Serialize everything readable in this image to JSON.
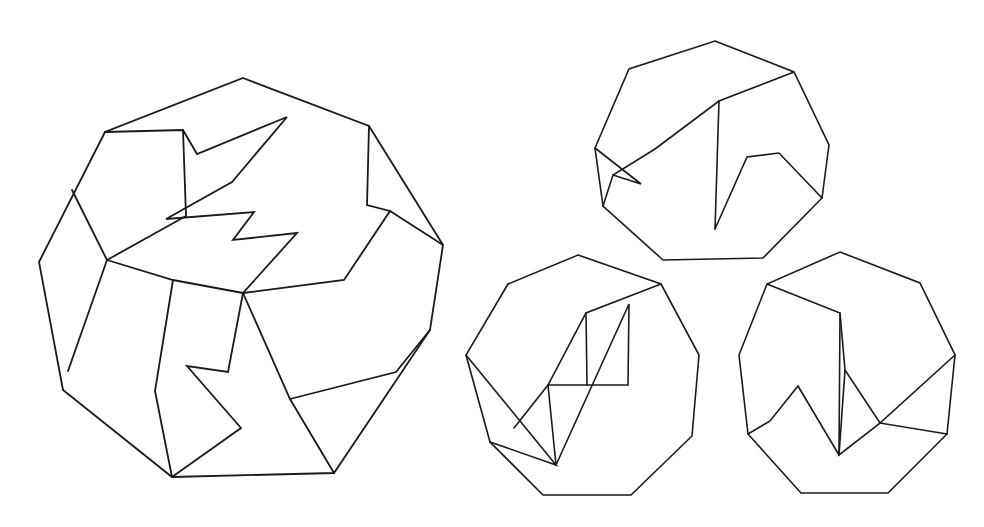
{
  "page": {
    "background_color": "#ffffff",
    "stroke_color": "#1a1a1a",
    "width": 984,
    "height": 527
  },
  "figures": [
    {
      "id": "large-nonagon",
      "name": "large-dissected-nonagon",
      "role": "source-polygon",
      "stroke_width": 1.8,
      "outline_label": "outer nonagon boundary",
      "outline": [
        [
          243,
          78
        ],
        [
          369,
          126
        ],
        [
          443,
          245
        ],
        [
          430,
          330
        ],
        [
          334,
          473
        ],
        [
          172,
          477
        ],
        [
          63,
          390
        ],
        [
          39,
          262
        ],
        [
          105,
          132
        ]
      ],
      "cuts": [
        {
          "name": "cut-upper-zigzag",
          "points": [
            [
              105,
              132
            ],
            [
              183,
              130
            ],
            [
              197,
              154
            ],
            [
              287,
              117
            ],
            [
              232,
              182
            ],
            [
              166,
              219
            ],
            [
              254,
              212
            ],
            [
              233,
              240
            ],
            [
              297,
              233
            ],
            [
              243,
              293
            ]
          ]
        },
        {
          "name": "cut-left-spoke",
          "points": [
            [
              183,
              130
            ],
            [
              186,
              216
            ],
            [
              107,
              260
            ],
            [
              68,
              371
            ]
          ]
        },
        {
          "name": "cut-left-mid-chord",
          "points": [
            [
              72,
              190
            ],
            [
              107,
              260
            ]
          ]
        },
        {
          "name": "cut-lower-left-chord",
          "points": [
            [
              107,
              260
            ],
            [
              173,
              280
            ],
            [
              243,
              293
            ]
          ]
        },
        {
          "name": "cut-lower-left-spoke",
          "points": [
            [
              173,
              280
            ],
            [
              155,
              391
            ],
            [
              172,
              477
            ]
          ]
        },
        {
          "name": "cut-lower-zigzag",
          "points": [
            [
              243,
              293
            ],
            [
              228,
              372
            ],
            [
              187,
              366
            ],
            [
              241,
              428
            ],
            [
              172,
              477
            ]
          ]
        },
        {
          "name": "cut-lower-right-spoke",
          "points": [
            [
              243,
              293
            ],
            [
              290,
              399
            ],
            [
              334,
              473
            ]
          ]
        },
        {
          "name": "cut-right-lower-chord",
          "points": [
            [
              290,
              399
            ],
            [
              396,
              372
            ],
            [
              430,
              330
            ]
          ]
        },
        {
          "name": "cut-right-mid-zigzag",
          "points": [
            [
              243,
              293
            ],
            [
              344,
              280
            ],
            [
              390,
              211
            ],
            [
              367,
              205
            ],
            [
              369,
              126
            ]
          ]
        },
        {
          "name": "cut-right-upper-chord",
          "points": [
            [
              390,
              211
            ],
            [
              443,
              245
            ]
          ]
        }
      ]
    },
    {
      "id": "small-nonagon-top",
      "name": "small-nonagon-top-right",
      "role": "piece-assembly-a",
      "stroke_width": 1.6,
      "outline": [
        [
          715,
          41
        ],
        [
          794,
          72
        ],
        [
          829,
          145
        ],
        [
          822,
          198
        ],
        [
          763,
          258
        ],
        [
          663,
          260
        ],
        [
          603,
          206
        ],
        [
          595,
          148
        ],
        [
          629,
          69
        ]
      ],
      "cuts": [
        {
          "name": "cut-top-diag",
          "points": [
            [
              794,
              72
            ],
            [
              719,
              101
            ],
            [
              655,
              149
            ],
            [
              613,
              175
            ],
            [
              603,
              206
            ]
          ]
        },
        {
          "name": "cut-top-vertical",
          "points": [
            [
              719,
              101
            ],
            [
              715,
              229
            ]
          ]
        },
        {
          "name": "cut-top-notch",
          "points": [
            [
              715,
              229
            ],
            [
              747,
              157
            ],
            [
              779,
              153
            ],
            [
              822,
              198
            ]
          ]
        },
        {
          "name": "cut-top-left-wedge",
          "points": [
            [
              595,
              148
            ],
            [
              641,
              184
            ],
            [
              613,
              175
            ]
          ]
        }
      ]
    },
    {
      "id": "small-nonagon-left",
      "name": "small-nonagon-bottom-left",
      "role": "piece-assembly-b",
      "stroke_width": 1.6,
      "outline": [
        [
          578,
          255
        ],
        [
          661,
          284
        ],
        [
          699,
          355
        ],
        [
          692,
          436
        ],
        [
          631,
          495
        ],
        [
          543,
          495
        ],
        [
          490,
          442
        ],
        [
          466,
          355
        ],
        [
          508,
          284
        ]
      ],
      "cuts": [
        {
          "name": "cut-left-diag",
          "points": [
            [
              661,
              284
            ],
            [
              586,
              313
            ],
            [
              548,
              385
            ],
            [
              514,
              428
            ]
          ]
        },
        {
          "name": "cut-left-vertical",
          "points": [
            [
              586,
              313
            ],
            [
              587,
              385
            ]
          ]
        },
        {
          "name": "cut-left-step",
          "points": [
            [
              548,
              385
            ],
            [
              628,
              385
            ],
            [
              629,
              304
            ],
            [
              556,
              465
            ]
          ]
        },
        {
          "name": "cut-left-fan",
          "points": [
            [
              466,
              355
            ],
            [
              556,
              465
            ],
            [
              490,
              442
            ]
          ]
        },
        {
          "name": "cut-left-notch-down",
          "points": [
            [
              548,
              385
            ],
            [
              556,
              465
            ]
          ]
        }
      ]
    },
    {
      "id": "small-nonagon-right",
      "name": "small-nonagon-bottom-right",
      "role": "piece-assembly-c",
      "stroke_width": 1.6,
      "outline": [
        [
          840,
          252
        ],
        [
          920,
          283
        ],
        [
          955,
          355
        ],
        [
          947,
          434
        ],
        [
          888,
          493
        ],
        [
          801,
          493
        ],
        [
          748,
          434
        ],
        [
          739,
          355
        ],
        [
          767,
          284
        ]
      ],
      "cuts": [
        {
          "name": "cut-right-diag",
          "points": [
            [
              767,
              284
            ],
            [
              840,
              313
            ],
            [
              845,
              370
            ],
            [
              880,
              423
            ],
            [
              955,
              355
            ]
          ]
        },
        {
          "name": "cut-right-vertical",
          "points": [
            [
              840,
              313
            ],
            [
              839,
              455
            ]
          ]
        },
        {
          "name": "cut-right-w-notch",
          "points": [
            [
              839,
              455
            ],
            [
              798,
              386
            ],
            [
              770,
              421
            ],
            [
              748,
              434
            ]
          ]
        },
        {
          "name": "cut-right-lower-fan",
          "points": [
            [
              845,
              370
            ],
            [
              839,
              455
            ],
            [
              880,
              423
            ],
            [
              947,
              434
            ]
          ]
        }
      ]
    }
  ]
}
